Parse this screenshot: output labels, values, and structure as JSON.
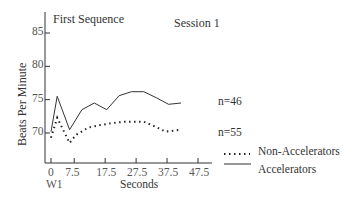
{
  "chart_data": {
    "type": "line",
    "title": "First Sequence",
    "subtitle": "Session 1",
    "xlabel": "Seconds",
    "ylabel": "Beats Per Minute",
    "x_ticks": [
      "0",
      "7.5",
      "17.5",
      "27.5",
      "37.5",
      "47.5"
    ],
    "x_tick_sublabel": "W1",
    "y_ticks": [
      "70",
      "75",
      "80",
      "85"
    ],
    "ylim": [
      66,
      88
    ],
    "xlim": [
      -1.5,
      52
    ],
    "grid": false,
    "legend_position": "bottom-right",
    "series": [
      {
        "name": "Accelerators",
        "style": "solid",
        "annotation": "n=46",
        "x": [
          0,
          2,
          6,
          10,
          14,
          18,
          22,
          26,
          30,
          34,
          38,
          42
        ],
        "values": [
          70.2,
          75.5,
          70.5,
          73.5,
          74.5,
          73.5,
          75.6,
          76.2,
          76.2,
          75.3,
          74.3,
          74.5
        ]
      },
      {
        "name": "Non-Accelerators",
        "style": "dotted",
        "annotation": "n=55",
        "x": [
          0,
          2,
          6,
          8,
          12,
          16,
          20,
          24,
          30,
          34,
          37,
          42
        ],
        "values": [
          69.3,
          72.3,
          68.5,
          69.7,
          70.8,
          71.2,
          71.5,
          71.7,
          71.7,
          70.9,
          70.2,
          70.5
        ]
      }
    ]
  }
}
